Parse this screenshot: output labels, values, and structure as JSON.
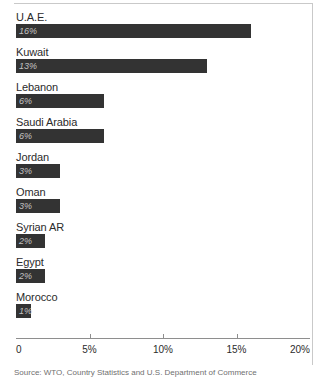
{
  "chart_data": {
    "type": "bar",
    "orientation": "horizontal",
    "title": "",
    "xlabel": "",
    "ylabel": "",
    "xlim": [
      0,
      20
    ],
    "grid": false,
    "legend": null,
    "categories": [
      "U.A.E.",
      "Kuwait",
      "Lebanon",
      "Saudi Arabia",
      "Jordan",
      "Oman",
      "Syrian AR",
      "Egypt",
      "Morocco"
    ],
    "values": [
      16,
      13,
      6,
      6,
      3,
      3,
      2,
      2,
      1
    ],
    "value_labels": [
      "16%",
      "13%",
      "6%",
      "6%",
      "3%",
      "3%",
      "2%",
      "2%",
      "1%"
    ],
    "bars": [
      {
        "label": "U.A.E.",
        "value": 16,
        "value_label": "16%"
      },
      {
        "label": "Kuwait",
        "value": 13,
        "value_label": "13%"
      },
      {
        "label": "Lebanon",
        "value": 6,
        "value_label": "6%"
      },
      {
        "label": "Saudi Arabia",
        "value": 6,
        "value_label": "6%"
      },
      {
        "label": "Jordan",
        "value": 3,
        "value_label": "3%"
      },
      {
        "label": "Oman",
        "value": 3,
        "value_label": "3%"
      },
      {
        "label": "Syrian AR",
        "value": 2,
        "value_label": "2%"
      },
      {
        "label": "Egypt",
        "value": 2,
        "value_label": "2%"
      },
      {
        "label": "Morocco",
        "value": 1,
        "value_label": "1%"
      }
    ],
    "xticks": [
      0,
      5,
      10,
      15,
      20
    ],
    "xticklabels": [
      "0",
      "5%",
      "10%",
      "15%",
      "20%"
    ],
    "bar_color": "#333333",
    "value_label_color": "#c2c2c2",
    "axis_color": "#8e8e8e",
    "source_note": "Source: WTO, Country Statistics and U.S. Department of Commerce"
  }
}
